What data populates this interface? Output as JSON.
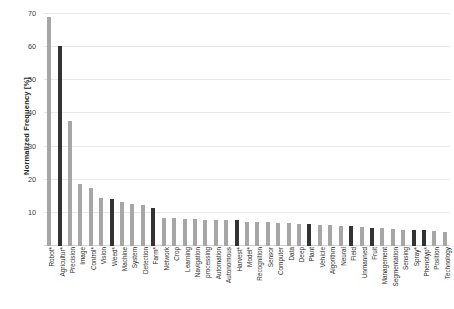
{
  "chart_data": {
    "type": "bar",
    "title": "",
    "xlabel": "",
    "ylabel": "Normalized Frequency [%]",
    "ylim": [
      0,
      70
    ],
    "yticks": [
      0,
      10,
      20,
      30,
      40,
      50,
      60,
      70
    ],
    "ytick_labels": [
      "",
      "10",
      "20",
      "30",
      "40",
      "50",
      "60",
      "70"
    ],
    "grid": true,
    "legend": "none",
    "categories": [
      "Robot*",
      "Agricultur*",
      "Precision",
      "Image",
      "Control*",
      "Vision",
      "Weed*",
      "Machine",
      "System",
      "Detection",
      "Farm*",
      "Network",
      "Crop",
      "Learning",
      "Navigation",
      "processing",
      "Automation",
      "Autonomous",
      "Harvest*",
      "Model*",
      "Recognition",
      "Sensor",
      "Computer",
      "Data",
      "Deep",
      "Plant",
      "Vehicle",
      "Algorithm",
      "Neural",
      "Field",
      "Unmanned",
      "Fruit",
      "Management",
      "Segmentation",
      "Sensing",
      "Spray*",
      "Phenotyp*",
      "Position",
      "Technology"
    ],
    "values": [
      69.0,
      60.5,
      37.8,
      18.8,
      17.4,
      14.5,
      14.2,
      13.2,
      12.8,
      12.4,
      11.6,
      8.6,
      8.4,
      8.2,
      8.1,
      8.0,
      7.9,
      7.8,
      7.7,
      7.3,
      7.2,
      7.1,
      7.0,
      6.9,
      6.6,
      6.5,
      6.3,
      6.2,
      6.0,
      5.9,
      5.6,
      5.5,
      5.3,
      5.1,
      4.9,
      4.8,
      4.7,
      4.4,
      4.2
    ],
    "highlight": [
      false,
      true,
      false,
      false,
      false,
      false,
      true,
      false,
      false,
      false,
      true,
      false,
      false,
      false,
      false,
      false,
      false,
      false,
      true,
      false,
      false,
      false,
      false,
      false,
      false,
      true,
      false,
      false,
      false,
      true,
      false,
      true,
      false,
      false,
      false,
      true,
      true,
      false,
      false
    ],
    "colors": {
      "bar_light": "#a6a6a6",
      "bar_dark": "#333333",
      "gridline": "#e8e8e8",
      "text": "#2b2b2b"
    }
  }
}
